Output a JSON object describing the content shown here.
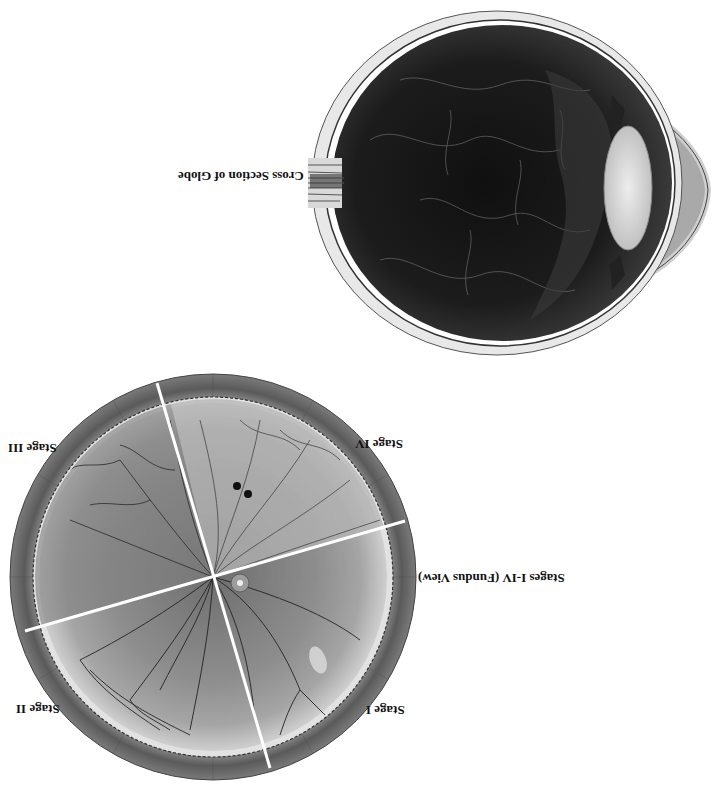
{
  "figure": {
    "orientation": "rotated-180",
    "globe": {
      "caption": "Cross Section of Globe",
      "parts": [
        "optic-nerve",
        "sclera",
        "retina",
        "vitreous",
        "lens",
        "cornea",
        "anterior-chamber",
        "ciliary-body"
      ]
    },
    "fundus": {
      "caption": "Stages I-IV (Fundus View)",
      "quadrants": [
        {
          "id": "stage-1",
          "label": "Stage I"
        },
        {
          "id": "stage-2",
          "label": "Stage II"
        },
        {
          "id": "stage-3",
          "label": "Stage III"
        },
        {
          "id": "stage-4",
          "label": "Stage IV"
        }
      ]
    },
    "colors": {
      "background": "#ffffff",
      "globe_interior": "#1e1e1e",
      "sclera": "#e6e6e6",
      "lens": "#d9d9d9",
      "cornea_chamber": "#a8a8a8",
      "fundus_rim": "#6f6f6f",
      "fundus_periphery": "#c9c9c9",
      "fundus_center": "#8c8c8c",
      "vessel": "#2a2a2a",
      "divider": "#ffffff"
    }
  }
}
